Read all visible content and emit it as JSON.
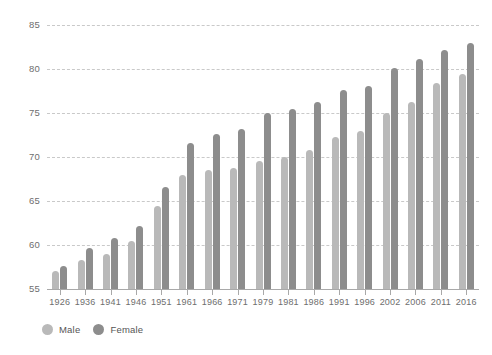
{
  "chart_data": {
    "type": "bar",
    "title": "",
    "subtitle": "",
    "xlabel": "",
    "ylabel": "",
    "ylim": [
      55,
      85
    ],
    "yticks": [
      55,
      60,
      65,
      70,
      75,
      80,
      85
    ],
    "ytick_labels": [
      "55",
      "60",
      "65",
      "70",
      "75",
      "80",
      "85"
    ],
    "grid": true,
    "legend_position": "bottom-left",
    "categories": [
      "1926",
      "1936",
      "1941",
      "1946",
      "1951",
      "1961",
      "1966",
      "1971",
      "1979",
      "1981",
      "1986",
      "1991",
      "1996",
      "2002",
      "2006",
      "2011",
      "2016"
    ],
    "series": [
      {
        "name": "Male",
        "color": "#b9b9b9",
        "values": [
          57.0,
          58.3,
          59.0,
          60.5,
          64.4,
          68.0,
          68.5,
          68.7,
          69.5,
          70.0,
          70.8,
          72.3,
          72.9,
          75.0,
          76.3,
          78.4,
          79.4
        ]
      },
      {
        "name": "Female",
        "color": "#8d8d8d",
        "values": [
          57.6,
          59.7,
          60.8,
          62.2,
          66.6,
          71.6,
          72.6,
          73.2,
          75.0,
          75.4,
          76.3,
          77.6,
          78.1,
          80.1,
          81.1,
          82.2,
          83.0
        ]
      }
    ]
  },
  "legend": {
    "items": [
      {
        "label": "Male",
        "color": "#b9b9b9"
      },
      {
        "label": "Female",
        "color": "#8d8d8d"
      }
    ]
  },
  "colors": {
    "background": "#ffffff",
    "gridline": "#c9c9c9",
    "axis": "#a9a9a9",
    "tick_text": "#6e6e6e",
    "legend_text": "#555555"
  }
}
